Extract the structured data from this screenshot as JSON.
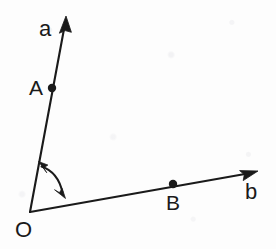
{
  "figure": {
    "kind": "geometry-angle-diagram",
    "width": 276,
    "height": 249,
    "background_color": "#fdfdfd",
    "stroke_color": "#1a1a1a",
    "stroke_width": 2
  },
  "labels": {
    "vertex": "O",
    "point_a": "A",
    "point_b": "B",
    "ray_a": "a",
    "ray_b": "b"
  },
  "geometry": {
    "vertex": {
      "x": 30,
      "y": 212
    },
    "ray_a": {
      "name": "a",
      "from": {
        "x": 30,
        "y": 212
      },
      "to": {
        "x": 66,
        "y": 18
      },
      "arrow_tip": {
        "x": 66,
        "y": 16
      },
      "label_pos": {
        "x": 39,
        "y": 18
      }
    },
    "ray_b": {
      "name": "b",
      "from": {
        "x": 30,
        "y": 212
      },
      "to": {
        "x": 256,
        "y": 172
      },
      "arrow_tip": {
        "x": 258,
        "y": 171
      },
      "label_pos": {
        "x": 245,
        "y": 181
      }
    },
    "point_a": {
      "name": "A",
      "x": 52,
      "y": 88,
      "dot_radius": 4,
      "label_pos": {
        "x": 29,
        "y": 77
      }
    },
    "point_b": {
      "name": "B",
      "x": 173,
      "y": 184,
      "dot_radius": 4,
      "label_pos": {
        "x": 166,
        "y": 192
      }
    },
    "vertex_label_pos": {
      "x": 15,
      "y": 219
    },
    "angle_arc": {
      "center": {
        "x": 30,
        "y": 212
      },
      "radius": 50,
      "double_headed": true,
      "start": {
        "x": 39,
        "y": 163
      },
      "end": {
        "x": 64,
        "y": 197
      },
      "control": {
        "x": 59,
        "y": 170
      },
      "head_a": {
        "x": 41,
        "y": 169
      },
      "head_b": {
        "x": 61,
        "y": 195
      }
    }
  }
}
